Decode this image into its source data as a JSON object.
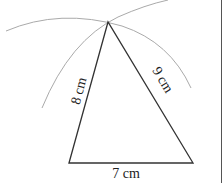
{
  "figure": {
    "type": "triangle-construction",
    "sides": [
      {
        "id": "base",
        "label": "7 cm"
      },
      {
        "id": "left",
        "label": "8 cm"
      },
      {
        "id": "right",
        "label": "9 cm"
      }
    ],
    "colors": {
      "line": "#333333",
      "arc": "#aaaaaa",
      "border": "#555555"
    }
  }
}
